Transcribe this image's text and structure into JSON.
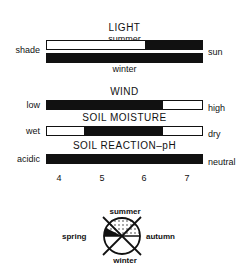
{
  "light": {
    "title": "LIGHT",
    "summer_label": "summer",
    "winter_label": "winter",
    "left_label": "shade",
    "right_label": "sun",
    "summer_bar": {
      "filled_from": 0.63,
      "filled_to": 1.0
    },
    "winter_bar": {
      "filled_from": 0.0,
      "filled_to": 1.0
    }
  },
  "wind": {
    "title": "WIND",
    "left_label": "low",
    "right_label": "high",
    "bar": {
      "filled_from": 0.0,
      "filled_to": 0.75
    }
  },
  "soil_moisture": {
    "title": "SOIL MOISTURE",
    "left_label": "wet",
    "right_label": "dry",
    "bar": {
      "filled_from": 0.24,
      "filled_to": 0.75
    }
  },
  "soil_ph": {
    "title": "SOIL REACTION–pH",
    "left_label": "acidic",
    "right_label": "neutral",
    "bar": {
      "filled_from": 0.0,
      "filled_to": 1.0
    },
    "ticks": [
      "4",
      "5",
      "6",
      "7"
    ]
  },
  "season_icon": {
    "top_label": "summer",
    "left_label": "spring",
    "right_label": "autumn",
    "bottom_label": "winter"
  }
}
